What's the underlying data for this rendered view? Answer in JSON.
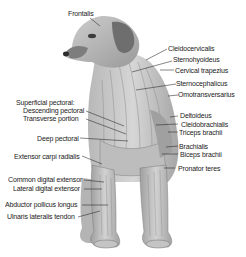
{
  "diagram": {
    "colors": {
      "background": "#ffffff",
      "text": "#1a1a1a",
      "leader_line": "#222222",
      "fur_light": "#d9d9d9",
      "fur_mid": "#a8a8a8",
      "fur_dark": "#5e5e5e"
    },
    "labels": {
      "frontalis": "Frontalis",
      "cleidocervicalis": "Cleidocervicalis",
      "sternohyoideus": "Sternohyoideus",
      "cervical_trapezius": "Cervical trapezius",
      "sternocephalicus": "Sternocephalicus",
      "omotransversarius": "Omotransversarius",
      "deltoideus": "Deltoideus",
      "cleidobrachialis": "Cleidobrachialis",
      "triceps_brachii": "Triceps brachii",
      "brachialis": "Brachialis",
      "biceps_brachii": "Biceps brachii",
      "pronator_teres": "Pronator teres",
      "superficial_pectoral": "Superficial pectoral:",
      "descending_pectoral": "Descending pectoral",
      "transverse_portion": "Transverse portion",
      "deep_pectoral": "Deep pectoral",
      "extensor_carpi_radialis": "Extensor carpi radialis",
      "common_digital_extensor": "Common digital extensor",
      "lateral_digital_extensor": "Lateral digital extensor",
      "abductor_pollicus_longus": "Abductor pollicus longus",
      "ulnaris_lateralis_tendon": "Ulnaris lateralis tendon"
    }
  }
}
